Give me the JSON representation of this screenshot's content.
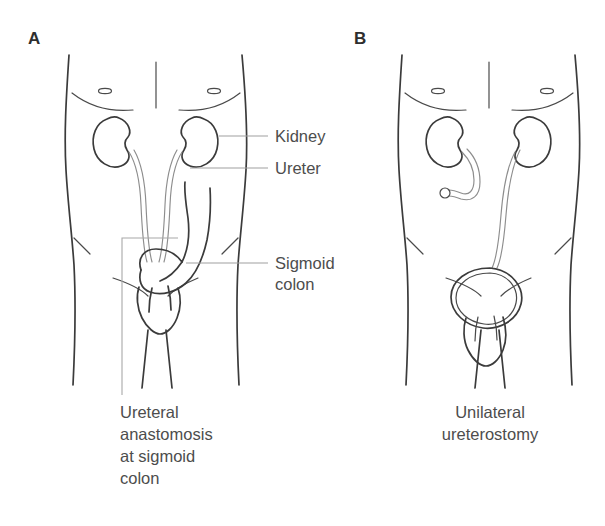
{
  "figure": {
    "background_color": "#ffffff",
    "line_color": "#3b3b3b",
    "tube_color": "#8d8d8d",
    "leader_color": "#a0a0a0",
    "text_color": "#4d4d4d"
  },
  "panel_a": {
    "letter": "A",
    "labels": {
      "kidney": "Kidney",
      "ureter": "Ureter",
      "sigmoid_colon_line1": "Sigmoid",
      "sigmoid_colon_line2": "colon"
    },
    "caption": {
      "line1": "Ureteral",
      "line2": "anastomosis",
      "line3": "at sigmoid",
      "line4": "colon"
    }
  },
  "panel_b": {
    "letter": "B",
    "caption": {
      "line1": "Unilateral",
      "line2": "ureterostomy"
    }
  }
}
